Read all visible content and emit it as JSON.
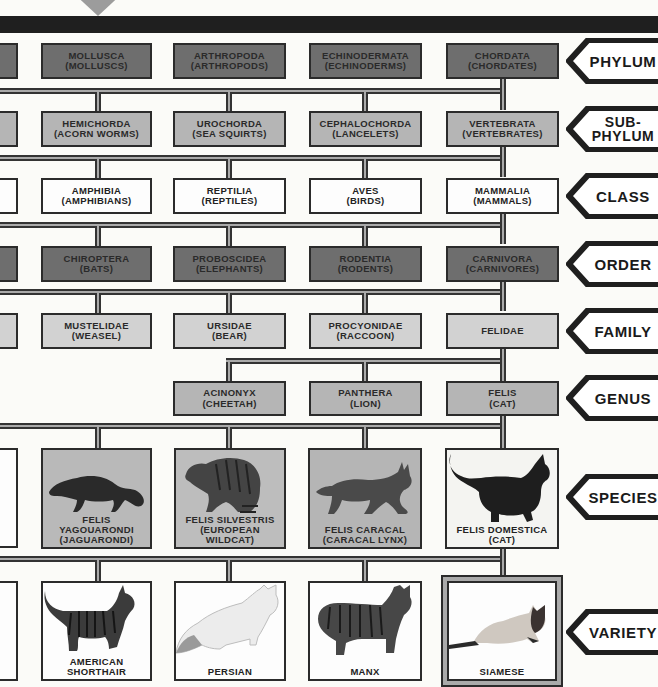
{
  "diagram": {
    "colors": {
      "phylum_order_fill": "#6e6e6e",
      "subphylum_genus_fill": "#b5b5b5",
      "family_fill": "#d2d2d2",
      "class_fill": "#fdfdfd",
      "line_dark": "#2b2b2b",
      "band": "#1f1f1f"
    },
    "ranks": [
      {
        "label": "PHYLUM"
      },
      {
        "label": "SUB-\nPHYLUM"
      },
      {
        "label": "CLASS"
      },
      {
        "label": "ORDER"
      },
      {
        "label": "FAMILY"
      },
      {
        "label": "GENUS"
      },
      {
        "label": "SPECIES"
      },
      {
        "label": "VARIETY"
      }
    ],
    "phylum": [
      {
        "name": "MOLLUSCA",
        "common": "(MOLLUSCS)"
      },
      {
        "name": "ARTHROPODA",
        "common": "(ARTHROPODS)"
      },
      {
        "name": "ECHINODERMATA",
        "common": "(ECHINODERMS)"
      },
      {
        "name": "CHORDATA",
        "common": "(CHORDATES)"
      }
    ],
    "subphylum": [
      {
        "name": "HEMICHORDA",
        "common": "(ACORN WORMS)"
      },
      {
        "name": "UROCHORDA",
        "common": "(SEA SQUIRTS)"
      },
      {
        "name": "CEPHALOCHORDA",
        "common": "(LANCELETS)"
      },
      {
        "name": "VERTEBRATA",
        "common": "(VERTEBRATES)"
      }
    ],
    "class": [
      {
        "name": "AMPHIBIA",
        "common": "(AMPHIBIANS)"
      },
      {
        "name": "REPTILIA",
        "common": "(REPTILES)"
      },
      {
        "name": "AVES",
        "common": "(BIRDS)"
      },
      {
        "name": "MAMMALIA",
        "common": "(MAMMALS)"
      }
    ],
    "order": [
      {
        "name": "CHIROPTERA",
        "common": "(BATS)"
      },
      {
        "name": "PROBOSCIDEA",
        "common": "(ELEPHANTS)"
      },
      {
        "name": "RODENTIA",
        "common": "(RODENTS)"
      },
      {
        "name": "CARNIVORA",
        "common": "(CARNIVORES)"
      }
    ],
    "family": [
      {
        "name": "MUSTELIDAE",
        "common": "(WEASEL)"
      },
      {
        "name": "URSIDAE",
        "common": "(BEAR)"
      },
      {
        "name": "PROCYONIDAE",
        "common": "(RACCOON)"
      },
      {
        "name": "FELIDAE",
        "common": ""
      }
    ],
    "genus": [
      {
        "name": "ACINONYX",
        "common": "(CHEETAH)"
      },
      {
        "name": "PANTHERA",
        "common": "(LION)"
      },
      {
        "name": "FELIS",
        "common": "(CAT)"
      }
    ],
    "species": [
      {
        "line1": "FELIS",
        "line2": "YAGOUARONDI",
        "line3": "(JAGUARONDI)",
        "image": "jaguarondi-illustration"
      },
      {
        "line1": "FELIS SILVESTRIS",
        "line2": "(EUROPEAN",
        "line3": "WILDCAT)",
        "image": "european-wildcat-illustration"
      },
      {
        "line1": "",
        "line2": "FELIS CARACAL",
        "line3": "(CARACAL LYNX)",
        "image": "caracal-lynx-illustration"
      },
      {
        "line1": "",
        "line2": "FELIS DOMESTICA",
        "line3": "(CAT)",
        "image": "domestic-cat-illustration"
      }
    ],
    "variety": [
      {
        "line1": "AMERICAN",
        "line2": "SHORTHAIR",
        "image": "american-shorthair-illustration"
      },
      {
        "line1": "",
        "line2": "PERSIAN",
        "image": "persian-cat-illustration"
      },
      {
        "line1": "",
        "line2": "MANX",
        "image": "manx-cat-illustration"
      },
      {
        "line1": "",
        "line2": "SIAMESE",
        "image": "siamese-cat-illustration"
      }
    ]
  }
}
